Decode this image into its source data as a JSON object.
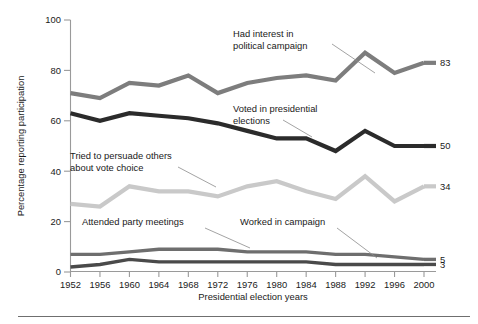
{
  "chart_data": {
    "type": "line",
    "title": "",
    "xlabel": "Presidential election years",
    "ylabel": "Percentage reporting participation",
    "categories": [
      "1952",
      "1956",
      "1960",
      "1964",
      "1968",
      "1972",
      "1976",
      "1980",
      "1984",
      "1988",
      "1992",
      "1996",
      "2000"
    ],
    "x": [
      1952,
      1956,
      1960,
      1964,
      1968,
      1972,
      1976,
      1980,
      1984,
      1988,
      1992,
      1996,
      2000
    ],
    "xlim": [
      1952,
      2000
    ],
    "ylim": [
      0,
      100
    ],
    "yticks": [
      "0",
      "20",
      "40",
      "60",
      "80",
      "100"
    ],
    "ytick_values": [
      0,
      20,
      40,
      60,
      80,
      100
    ],
    "grid": false,
    "legend_position": "inline-annotations",
    "series": [
      {
        "name": "Had interest in political campaign",
        "color": "#7d7d7d",
        "end_label": "83",
        "values": [
          71,
          69,
          75,
          74,
          78,
          71,
          75,
          77,
          78,
          76,
          87,
          79,
          83
        ]
      },
      {
        "name": "Voted in presidential elections",
        "color": "#2b2b2b",
        "end_label": "50",
        "values": [
          63,
          60,
          63,
          62,
          61,
          59,
          56,
          53,
          53,
          48,
          56,
          50,
          50
        ]
      },
      {
        "name": "Tried to persuade others about vote choice",
        "color": "#c9c9c9",
        "end_label": "34",
        "values": [
          27,
          26,
          34,
          32,
          32,
          30,
          34,
          36,
          32,
          29,
          38,
          28,
          34
        ]
      },
      {
        "name": "Attended party meetings",
        "color": "#6e6e6e",
        "end_label": "5",
        "values": [
          7,
          7,
          8,
          9,
          9,
          9,
          8,
          8,
          8,
          7,
          7,
          6,
          5
        ]
      },
      {
        "name": "Worked in campaign",
        "color": "#4a4a4a",
        "end_label": "3",
        "values": [
          2,
          3,
          5,
          4,
          4,
          4,
          4,
          4,
          4,
          3,
          3,
          3,
          3
        ]
      }
    ],
    "annotations": [
      {
        "id": "interest",
        "line1": "Had interest in",
        "line2": "political campaign",
        "text_x": 233,
        "text_y": 37,
        "leader": [
          [
            332,
            44
          ],
          [
            375,
            73
          ]
        ]
      },
      {
        "id": "voted",
        "line1": "Voted in presidential",
        "line2": "elections",
        "text_x": 233,
        "text_y": 112,
        "leader": [
          [
            283,
            120
          ],
          [
            312,
            137
          ]
        ]
      },
      {
        "id": "persuade",
        "line1": "Tried to persuade others",
        "line2": "about vote choice",
        "text_x": 70,
        "text_y": 159,
        "leader": [
          [
            178,
            167
          ],
          [
            216,
            187
          ]
        ]
      },
      {
        "id": "meetings",
        "line1": "Attended party meetings",
        "line2": "",
        "text_x": 82,
        "text_y": 225,
        "leader": [
          [
            205,
            228
          ],
          [
            250,
            248
          ]
        ]
      },
      {
        "id": "worked",
        "line1": "Worked in campaign",
        "line2": "",
        "text_x": 240,
        "text_y": 225,
        "leader": [
          [
            337,
            228
          ],
          [
            377,
            258
          ]
        ]
      }
    ]
  },
  "figure": {
    "y_axis_title": "Percentage reporting participation",
    "x_axis_title": "Presidential election years"
  }
}
